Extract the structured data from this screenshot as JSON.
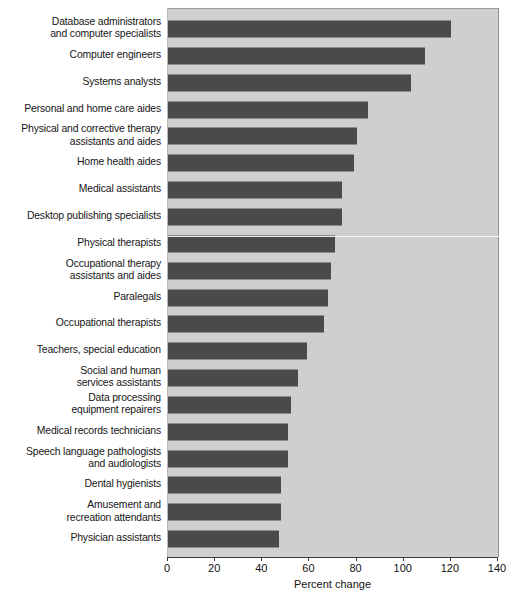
{
  "chart_data": {
    "type": "bar",
    "orientation": "horizontal",
    "title": "",
    "xlabel": "Percent change",
    "ylabel": "",
    "xlim": [
      0,
      140
    ],
    "xticks": [
      0,
      20,
      40,
      60,
      80,
      100,
      120,
      140
    ],
    "grid": false,
    "legend": null,
    "colors": {
      "bar": "#4a4a4a",
      "plot_background": "#cfcfcf",
      "page_background": "#ffffff",
      "axis": "#3a3a3a",
      "text": "#111111"
    },
    "categories": [
      "Database administrators\nand computer specialists",
      "Computer engineers",
      "Systems analysts",
      "Personal and home care aides",
      "Physical and corrective therapy\nassistants and aides",
      "Home health aides",
      "Medical assistants",
      "Desktop publishing specialists",
      "Physical therapists",
      "Occupational therapy\nassistants and aides",
      "Paralegals",
      "Occupational therapists",
      "Teachers, special education",
      "Social and human\nservices assistants",
      "Data processing\nequipment repairers",
      "Medical records technicians",
      "Speech language pathologists\nand audiologists",
      "Dental hygienists",
      "Amusement and\nrecreation attendants",
      "Physician assistants"
    ],
    "values": [
      120,
      109,
      103,
      85,
      80,
      79,
      74,
      74,
      71,
      69,
      68,
      66,
      59,
      55,
      52,
      51,
      51,
      48,
      48,
      47
    ]
  },
  "axis": {
    "tick_labels": [
      "0",
      "20",
      "40",
      "60",
      "80",
      "100",
      "120",
      "140"
    ],
    "title": "Percent change"
  }
}
